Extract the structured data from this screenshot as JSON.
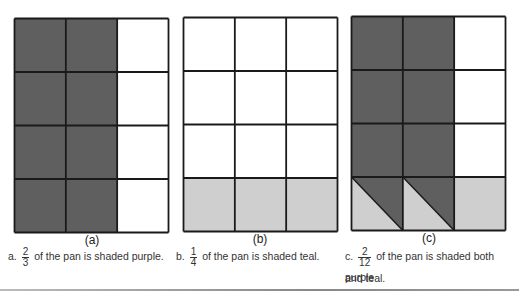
{
  "colors": {
    "purple": "#5f5f5f",
    "teal": "#cfcfcf",
    "empty": "#ffffff",
    "line": "#1a1a1a"
  },
  "panels": [
    {
      "id": "a",
      "label": "(a)",
      "caption": {
        "prefix": "a.",
        "numerator": "2",
        "denominator": "3",
        "text": "of the pan is shaded purple."
      },
      "rows": 4,
      "cols": 3,
      "cells": [
        [
          "purple",
          "purple",
          "empty"
        ],
        [
          "purple",
          "purple",
          "empty"
        ],
        [
          "purple",
          "purple",
          "empty"
        ],
        [
          "purple",
          "purple",
          "empty"
        ]
      ]
    },
    {
      "id": "b",
      "label": "(b)",
      "caption": {
        "prefix": "b.",
        "numerator": "1",
        "denominator": "4",
        "text": "of the pan is shaded teal."
      },
      "rows": 4,
      "cols": 3,
      "cells": [
        [
          "empty",
          "empty",
          "empty"
        ],
        [
          "empty",
          "empty",
          "empty"
        ],
        [
          "empty",
          "empty",
          "empty"
        ],
        [
          "teal",
          "teal",
          "teal"
        ]
      ]
    },
    {
      "id": "c",
      "label": "(c)",
      "caption": {
        "prefix": "c.",
        "numerator": "2",
        "denominator": "12",
        "text": "of the pan is shaded both purple",
        "text2": "and teal."
      },
      "rows": 4,
      "cols": 3,
      "cells": [
        [
          "purple",
          "purple",
          "empty"
        ],
        [
          "purple",
          "purple",
          "empty"
        ],
        [
          "purple",
          "purple",
          "empty"
        ],
        [
          "both",
          "both",
          "teal"
        ]
      ]
    }
  ]
}
